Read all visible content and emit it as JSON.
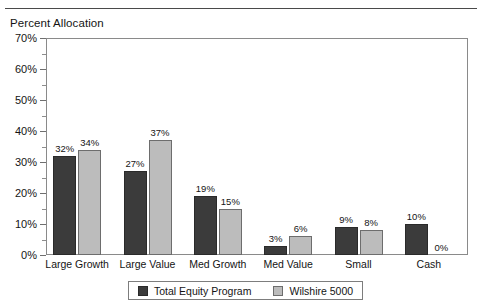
{
  "top_rule": "",
  "chart_data": {
    "type": "bar",
    "title": "Percent Allocation",
    "xlabel": "",
    "ylabel": "",
    "ylim": [
      0,
      70
    ],
    "ytick_step": 10,
    "yminor_step": 5,
    "grid": false,
    "legend_position": "bottom",
    "value_label_suffix": "%",
    "categories": [
      "Large Growth",
      "Large Value",
      "Med Growth",
      "Med Value",
      "Small",
      "Cash"
    ],
    "ytick_labels": [
      "70%",
      "60%",
      "50%",
      "40%",
      "30%",
      "20%",
      "10%",
      "0%"
    ],
    "ytick_values": [
      70,
      60,
      50,
      40,
      30,
      20,
      10,
      0
    ],
    "series": [
      {
        "name": "Total Equity Program",
        "color": "#3b3b3b",
        "values": [
          32,
          27,
          19,
          3,
          9,
          10
        ],
        "labels": [
          "32%",
          "27%",
          "19%",
          "3%",
          "9%",
          "10%"
        ]
      },
      {
        "name": "Wilshire 5000",
        "color": "#bcbcbc",
        "values": [
          34,
          37,
          15,
          6,
          8,
          0
        ],
        "labels": [
          "34%",
          "37%",
          "15%",
          "6%",
          "8%",
          "0%"
        ]
      }
    ]
  }
}
